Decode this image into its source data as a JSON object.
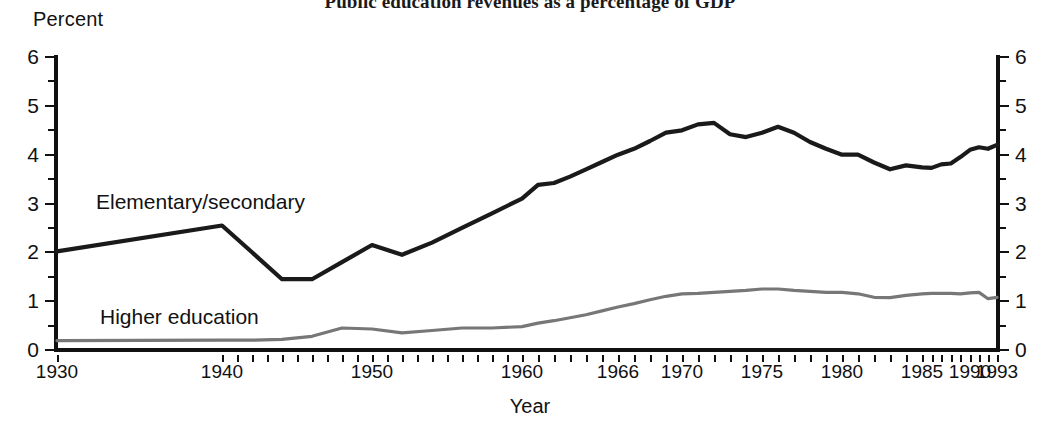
{
  "title": "Public education revenues as a percentage of GDP",
  "y_axis_unit": "Percent",
  "x_axis_name": "Year",
  "series_labels": {
    "elementary": "Elementary/secondary",
    "higher": "Higher education"
  },
  "colors": {
    "elementary": "#1a1a1a",
    "higher": "#777777",
    "axis": "#111111",
    "background": "#ffffff"
  },
  "y_ticks": [
    "0",
    "1",
    "2",
    "3",
    "4",
    "5",
    "6"
  ],
  "x_ticks": [
    "1930",
    "1940",
    "1950",
    "1960",
    "1966",
    "1970",
    "1975",
    "1980",
    "1985",
    "1990",
    "1993"
  ],
  "chart_data": {
    "type": "line",
    "title": "Public education revenues as a percentage of GDP",
    "xlabel": "Year",
    "ylabel": "Percent",
    "ylim": [
      0,
      6
    ],
    "xlim": [
      1930,
      1993
    ],
    "grid": false,
    "legend": "inline-labels",
    "y_major_step": 1,
    "y_minor_step": 0.5,
    "series": [
      {
        "name": "Elementary/secondary",
        "color": "#1a1a1a",
        "x": [
          1930,
          1940,
          1942,
          1944,
          1946,
          1948,
          1950,
          1952,
          1954,
          1956,
          1958,
          1960,
          1961,
          1962,
          1963,
          1964,
          1965,
          1966,
          1967,
          1968,
          1969,
          1970,
          1971,
          1972,
          1973,
          1974,
          1975,
          1976,
          1977,
          1978,
          1979,
          1980,
          1981,
          1982,
          1983,
          1984,
          1985,
          1986,
          1987,
          1988,
          1989,
          1990,
          1991,
          1992,
          1993
        ],
        "values": [
          2.02,
          2.55,
          2.0,
          1.45,
          1.45,
          1.8,
          2.15,
          1.95,
          2.2,
          2.5,
          2.8,
          3.1,
          3.38,
          3.42,
          3.55,
          3.7,
          3.85,
          4.0,
          4.12,
          4.28,
          4.45,
          4.5,
          4.62,
          4.65,
          4.42,
          4.36,
          4.45,
          4.57,
          4.45,
          4.26,
          4.12,
          4.0,
          4.0,
          3.84,
          3.7,
          3.78,
          3.74,
          3.73,
          3.8,
          3.82,
          3.95,
          4.1,
          4.15,
          4.12,
          4.2
        ]
      },
      {
        "name": "Higher education",
        "color": "#777777",
        "x": [
          1930,
          1940,
          1942,
          1944,
          1946,
          1948,
          1950,
          1952,
          1954,
          1956,
          1958,
          1960,
          1961,
          1962,
          1963,
          1964,
          1965,
          1966,
          1967,
          1968,
          1969,
          1970,
          1971,
          1972,
          1973,
          1974,
          1975,
          1976,
          1977,
          1978,
          1979,
          1980,
          1981,
          1982,
          1983,
          1984,
          1985,
          1986,
          1987,
          1988,
          1989,
          1990,
          1991,
          1992,
          1993
        ],
        "values": [
          0.19,
          0.2,
          0.2,
          0.22,
          0.28,
          0.45,
          0.43,
          0.35,
          0.4,
          0.45,
          0.45,
          0.48,
          0.55,
          0.6,
          0.66,
          0.72,
          0.8,
          0.88,
          0.95,
          1.03,
          1.1,
          1.15,
          1.16,
          1.18,
          1.2,
          1.22,
          1.25,
          1.25,
          1.22,
          1.2,
          1.18,
          1.18,
          1.15,
          1.08,
          1.07,
          1.12,
          1.15,
          1.16,
          1.16,
          1.16,
          1.15,
          1.17,
          1.18,
          1.05,
          1.08
        ]
      }
    ]
  }
}
